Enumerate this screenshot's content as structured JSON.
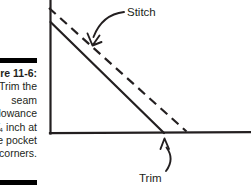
{
  "figure": {
    "number_label": "ure 11-6:",
    "caption_lines": [
      "Trim the",
      "seam",
      "lowance",
      "⁄₄ inch at",
      "e pocket",
      "corners."
    ],
    "rule_color": "#000000"
  },
  "diagram": {
    "line_color": "#231f20",
    "background": "#ffffff",
    "annotations": [
      {
        "name": "stitch",
        "label": "Stitch",
        "points_to": "dashed stitching line",
        "arrow": "curved-down-left"
      },
      {
        "name": "trim",
        "label": "Trim",
        "points_to": "trimmed corner point on baseline",
        "arrow": "curved-up"
      }
    ],
    "elements": {
      "vertical_edge": "solid vertical fabric edge",
      "horizontal_edge": "solid horizontal fabric edge",
      "cut_edge": "solid diagonal trimmed seam allowance edge",
      "stitch_line": "dashed diagonal stitching line"
    }
  }
}
